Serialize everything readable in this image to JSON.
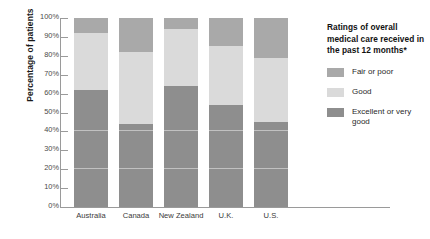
{
  "chart_data": {
    "type": "bar",
    "subtype": "stacked-bar-100-percent",
    "title": "",
    "xlabel": "",
    "ylabel": "Percentage of patients",
    "ylim": [
      0,
      100
    ],
    "ytick_labels": [
      "100%",
      "90%",
      "80%",
      "70%",
      "60%",
      "50%",
      "40%",
      "30%",
      "20%",
      "10%",
      "0%"
    ],
    "ytick_values": [
      100,
      90,
      80,
      70,
      60,
      50,
      40,
      30,
      20,
      10,
      0
    ],
    "grid": false,
    "legend_position": "right",
    "categories": [
      "Australia",
      "Canada",
      "New Zealand",
      "U.K.",
      "U.S."
    ],
    "series": [
      {
        "name": "Excellent or very good",
        "color": "#8e8e8e",
        "values": [
          62,
          44,
          64,
          54,
          45
        ]
      },
      {
        "name": "Good",
        "color": "#dadada",
        "values": [
          30,
          38,
          30,
          31,
          34
        ]
      },
      {
        "name": "Fair or poor",
        "color": "#a9a9a9",
        "values": [
          8,
          18,
          6,
          15,
          21
        ]
      }
    ],
    "stack_order_top_to_bottom": [
      "Fair or poor",
      "Good",
      "Excellent or very good"
    ]
  },
  "legend": {
    "title": "Ratings of overall medical care received in the past 12 months*",
    "items": [
      {
        "label": "Fair or poor",
        "color": "#a9a9a9"
      },
      {
        "label": "Good",
        "color": "#dadada"
      },
      {
        "label": "Excellent or very good",
        "color": "#8e8e8e"
      }
    ]
  }
}
